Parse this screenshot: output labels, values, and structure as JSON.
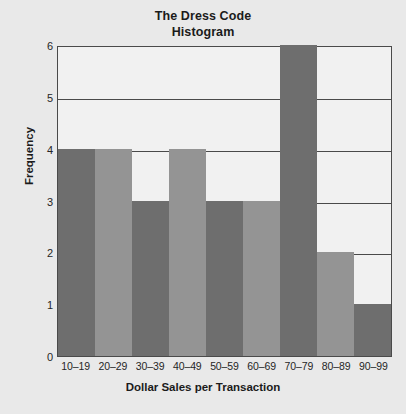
{
  "chart_data": {
    "type": "bar",
    "title": "The Dress Code",
    "subtitle": "Histogram",
    "xlabel": "Dollar Sales per Transaction",
    "ylabel": "Frequency",
    "categories": [
      "10–19",
      "20–29",
      "30–39",
      "40–49",
      "50–59",
      "60–69",
      "70–79",
      "80–89",
      "90–99"
    ],
    "values": [
      4,
      4,
      3,
      4,
      3,
      3,
      6,
      2,
      1
    ],
    "bar_colors": [
      "#6e6e6e",
      "#949494",
      "#6e6e6e",
      "#949494",
      "#6e6e6e",
      "#949494",
      "#6e6e6e",
      "#949494",
      "#6e6e6e"
    ],
    "ylim": [
      0,
      6
    ],
    "yticks": [
      0,
      1,
      2,
      3,
      4,
      5,
      6
    ],
    "ytick_labels": [
      "0",
      "1",
      "2",
      "3",
      "4",
      "5",
      "6"
    ],
    "grid": "horizontal",
    "legend": "none"
  },
  "style": {
    "background": "#e9e9e9",
    "plot_background": "#f1f1f1",
    "axis_color": "#4a4a4a",
    "text_color": "#1b1b1b",
    "dark_bar": "#6e6e6e",
    "light_bar": "#949494"
  }
}
